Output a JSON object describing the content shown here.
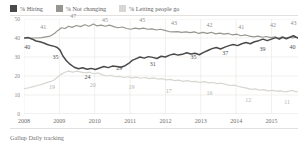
{
  "legend": {
    "items": [
      {
        "label": "% Hiring",
        "color": "#4a4a4c",
        "name": "legend-hiring"
      },
      {
        "label": "% Not changing",
        "color": "#97958f",
        "name": "legend-not-changing"
      },
      {
        "label": "% Letting people go",
        "color": "#d8d6d2",
        "name": "legend-letting-people-go"
      }
    ]
  },
  "footer": {
    "source": "Gallup Daily tracking"
  },
  "chart_data": {
    "type": "line",
    "title": "",
    "subtitle": "",
    "xlabel": "",
    "ylabel": "",
    "ylim": [
      0,
      50
    ],
    "yticks": [
      0,
      10,
      20,
      30,
      40,
      50
    ],
    "xticks": [
      "2008",
      "2009",
      "2010",
      "2011",
      "2012",
      "2013",
      "2014",
      "2015"
    ],
    "xlim": [
      2008,
      2015.75
    ],
    "grid": true,
    "legend_position": "top-left",
    "series": [
      {
        "name": "% Hiring",
        "color": "#4a4a4c",
        "labels": [
          {
            "x": 2008.15,
            "y": 40,
            "text": "40"
          },
          {
            "x": 2008.95,
            "y": 35,
            "text": "35"
          },
          {
            "x": 2009.85,
            "y": 24,
            "text": "24"
          },
          {
            "x": 2010.75,
            "y": 29,
            "text": "29"
          },
          {
            "x": 2011.7,
            "y": 31,
            "text": "31"
          },
          {
            "x": 2012.85,
            "y": 35,
            "text": "35"
          },
          {
            "x": 2013.75,
            "y": 37,
            "text": "37"
          },
          {
            "x": 2014.8,
            "y": 39,
            "text": "39"
          },
          {
            "x": 2015.65,
            "y": 40,
            "text": "40"
          }
        ],
        "points": [
          {
            "x": 2008.02,
            "y": 40.0
          },
          {
            "x": 2008.12,
            "y": 40.2
          },
          {
            "x": 2008.22,
            "y": 39.5
          },
          {
            "x": 2008.34,
            "y": 38.4
          },
          {
            "x": 2008.45,
            "y": 38.0
          },
          {
            "x": 2008.56,
            "y": 37.4
          },
          {
            "x": 2008.66,
            "y": 36.6
          },
          {
            "x": 2008.76,
            "y": 36.0
          },
          {
            "x": 2008.86,
            "y": 35.6
          },
          {
            "x": 2008.94,
            "y": 35.0
          },
          {
            "x": 2009.02,
            "y": 33.6
          },
          {
            "x": 2009.1,
            "y": 30.5
          },
          {
            "x": 2009.2,
            "y": 28.0
          },
          {
            "x": 2009.3,
            "y": 26.2
          },
          {
            "x": 2009.42,
            "y": 24.6
          },
          {
            "x": 2009.54,
            "y": 23.8
          },
          {
            "x": 2009.66,
            "y": 24.3
          },
          {
            "x": 2009.78,
            "y": 23.6
          },
          {
            "x": 2009.9,
            "y": 24.0
          },
          {
            "x": 2010.02,
            "y": 23.4
          },
          {
            "x": 2010.14,
            "y": 24.2
          },
          {
            "x": 2010.26,
            "y": 25.0
          },
          {
            "x": 2010.38,
            "y": 24.4
          },
          {
            "x": 2010.5,
            "y": 25.2
          },
          {
            "x": 2010.62,
            "y": 25.0
          },
          {
            "x": 2010.74,
            "y": 24.6
          },
          {
            "x": 2010.86,
            "y": 25.4
          },
          {
            "x": 2010.96,
            "y": 26.6
          },
          {
            "x": 2011.06,
            "y": 28.2
          },
          {
            "x": 2011.16,
            "y": 29.0
          },
          {
            "x": 2011.28,
            "y": 30.0
          },
          {
            "x": 2011.4,
            "y": 29.4
          },
          {
            "x": 2011.52,
            "y": 30.2
          },
          {
            "x": 2011.64,
            "y": 29.8
          },
          {
            "x": 2011.76,
            "y": 29.2
          },
          {
            "x": 2011.88,
            "y": 30.4
          },
          {
            "x": 2012.0,
            "y": 30.0
          },
          {
            "x": 2012.12,
            "y": 31.0
          },
          {
            "x": 2012.24,
            "y": 31.6
          },
          {
            "x": 2012.36,
            "y": 31.0
          },
          {
            "x": 2012.48,
            "y": 31.4
          },
          {
            "x": 2012.6,
            "y": 32.2
          },
          {
            "x": 2012.72,
            "y": 31.6
          },
          {
            "x": 2012.84,
            "y": 32.0
          },
          {
            "x": 2012.96,
            "y": 31.2
          },
          {
            "x": 2013.08,
            "y": 32.4
          },
          {
            "x": 2013.2,
            "y": 33.4
          },
          {
            "x": 2013.32,
            "y": 34.4
          },
          {
            "x": 2013.44,
            "y": 35.0
          },
          {
            "x": 2013.56,
            "y": 34.2
          },
          {
            "x": 2013.68,
            "y": 35.2
          },
          {
            "x": 2013.8,
            "y": 36.0
          },
          {
            "x": 2013.92,
            "y": 36.6
          },
          {
            "x": 2014.04,
            "y": 36.0
          },
          {
            "x": 2014.16,
            "y": 37.0
          },
          {
            "x": 2014.28,
            "y": 37.6
          },
          {
            "x": 2014.4,
            "y": 37.0
          },
          {
            "x": 2014.52,
            "y": 38.0
          },
          {
            "x": 2014.64,
            "y": 38.6
          },
          {
            "x": 2014.76,
            "y": 39.4
          },
          {
            "x": 2014.88,
            "y": 38.6
          },
          {
            "x": 2015.0,
            "y": 39.4
          },
          {
            "x": 2015.12,
            "y": 40.2
          },
          {
            "x": 2015.22,
            "y": 39.4
          },
          {
            "x": 2015.32,
            "y": 40.4
          },
          {
            "x": 2015.42,
            "y": 39.6
          },
          {
            "x": 2015.52,
            "y": 40.4
          },
          {
            "x": 2015.62,
            "y": 41.2
          },
          {
            "x": 2015.7,
            "y": 40.4
          },
          {
            "x": 2015.75,
            "y": 40.0
          }
        ]
      },
      {
        "name": "% Not changing",
        "color": "#97958f",
        "labels": [
          {
            "x": 2008.6,
            "y": 41,
            "text": "41"
          },
          {
            "x": 2009.45,
            "y": 47,
            "text": "47"
          },
          {
            "x": 2010.35,
            "y": 45,
            "text": "45"
          },
          {
            "x": 2011.4,
            "y": 45,
            "text": "45"
          },
          {
            "x": 2012.3,
            "y": 43,
            "text": "43"
          },
          {
            "x": 2013.3,
            "y": 42,
            "text": "42"
          },
          {
            "x": 2014.2,
            "y": 41,
            "text": "41"
          },
          {
            "x": 2015.1,
            "y": 42,
            "text": "42"
          },
          {
            "x": 2015.68,
            "y": 43,
            "text": "43"
          }
        ],
        "points": [
          {
            "x": 2008.02,
            "y": 40.0
          },
          {
            "x": 2008.14,
            "y": 40.0
          },
          {
            "x": 2008.26,
            "y": 40.0
          },
          {
            "x": 2008.38,
            "y": 40.0
          },
          {
            "x": 2008.5,
            "y": 40.2
          },
          {
            "x": 2008.62,
            "y": 40.6
          },
          {
            "x": 2008.74,
            "y": 41.0
          },
          {
            "x": 2008.86,
            "y": 42.4
          },
          {
            "x": 2008.96,
            "y": 44.0
          },
          {
            "x": 2009.06,
            "y": 45.4
          },
          {
            "x": 2009.16,
            "y": 45.0
          },
          {
            "x": 2009.26,
            "y": 46.2
          },
          {
            "x": 2009.36,
            "y": 45.6
          },
          {
            "x": 2009.48,
            "y": 46.6
          },
          {
            "x": 2009.6,
            "y": 46.0
          },
          {
            "x": 2009.72,
            "y": 47.0
          },
          {
            "x": 2009.84,
            "y": 46.2
          },
          {
            "x": 2009.96,
            "y": 47.4
          },
          {
            "x": 2010.06,
            "y": 46.4
          },
          {
            "x": 2010.18,
            "y": 46.8
          },
          {
            "x": 2010.3,
            "y": 46.2
          },
          {
            "x": 2010.42,
            "y": 46.8
          },
          {
            "x": 2010.54,
            "y": 46.0
          },
          {
            "x": 2010.66,
            "y": 45.4
          },
          {
            "x": 2010.78,
            "y": 45.8
          },
          {
            "x": 2010.9,
            "y": 45.0
          },
          {
            "x": 2011.02,
            "y": 44.6
          },
          {
            "x": 2011.14,
            "y": 45.2
          },
          {
            "x": 2011.26,
            "y": 44.8
          },
          {
            "x": 2011.38,
            "y": 45.2
          },
          {
            "x": 2011.5,
            "y": 44.6
          },
          {
            "x": 2011.62,
            "y": 44.8
          },
          {
            "x": 2011.74,
            "y": 44.2
          },
          {
            "x": 2011.86,
            "y": 44.6
          },
          {
            "x": 2011.98,
            "y": 44.0
          },
          {
            "x": 2012.1,
            "y": 43.4
          },
          {
            "x": 2012.22,
            "y": 43.2
          },
          {
            "x": 2012.34,
            "y": 43.4
          },
          {
            "x": 2012.46,
            "y": 43.0
          },
          {
            "x": 2012.58,
            "y": 43.2
          },
          {
            "x": 2012.7,
            "y": 42.8
          },
          {
            "x": 2012.82,
            "y": 43.2
          },
          {
            "x": 2012.94,
            "y": 42.4
          },
          {
            "x": 2013.06,
            "y": 43.0
          },
          {
            "x": 2013.18,
            "y": 42.4
          },
          {
            "x": 2013.3,
            "y": 43.0
          },
          {
            "x": 2013.42,
            "y": 42.2
          },
          {
            "x": 2013.54,
            "y": 42.6
          },
          {
            "x": 2013.66,
            "y": 42.0
          },
          {
            "x": 2013.78,
            "y": 42.4
          },
          {
            "x": 2013.9,
            "y": 41.6
          },
          {
            "x": 2014.02,
            "y": 42.0
          },
          {
            "x": 2014.14,
            "y": 41.2
          },
          {
            "x": 2014.26,
            "y": 41.6
          },
          {
            "x": 2014.38,
            "y": 41.0
          },
          {
            "x": 2014.5,
            "y": 40.6
          },
          {
            "x": 2014.62,
            "y": 41.0
          },
          {
            "x": 2014.74,
            "y": 40.4
          },
          {
            "x": 2014.86,
            "y": 40.8
          },
          {
            "x": 2014.98,
            "y": 40.2
          },
          {
            "x": 2015.1,
            "y": 40.6
          },
          {
            "x": 2015.2,
            "y": 40.0
          },
          {
            "x": 2015.3,
            "y": 40.6
          },
          {
            "x": 2015.4,
            "y": 40.0
          },
          {
            "x": 2015.5,
            "y": 40.4
          },
          {
            "x": 2015.6,
            "y": 40.0
          },
          {
            "x": 2015.68,
            "y": 40.4
          },
          {
            "x": 2015.75,
            "y": 40.2
          }
        ]
      },
      {
        "name": "% Letting people go",
        "color": "#d8d6d2",
        "labels": [
          {
            "x": 2008.85,
            "y": 19,
            "text": "19"
          },
          {
            "x": 2010.0,
            "y": 20,
            "text": "20"
          },
          {
            "x": 2011.1,
            "y": 19,
            "text": "19"
          },
          {
            "x": 2012.15,
            "y": 17,
            "text": "17"
          },
          {
            "x": 2013.3,
            "y": 16,
            "text": "16"
          },
          {
            "x": 2014.4,
            "y": 12,
            "text": "12"
          },
          {
            "x": 2015.5,
            "y": 11,
            "text": "11"
          }
        ],
        "points": [
          {
            "x": 2008.02,
            "y": 13.4
          },
          {
            "x": 2008.14,
            "y": 13.8
          },
          {
            "x": 2008.26,
            "y": 14.4
          },
          {
            "x": 2008.38,
            "y": 15.0
          },
          {
            "x": 2008.5,
            "y": 15.6
          },
          {
            "x": 2008.62,
            "y": 16.4
          },
          {
            "x": 2008.74,
            "y": 17.0
          },
          {
            "x": 2008.86,
            "y": 18.0
          },
          {
            "x": 2008.96,
            "y": 19.6
          },
          {
            "x": 2009.06,
            "y": 21.0
          },
          {
            "x": 2009.16,
            "y": 22.0
          },
          {
            "x": 2009.26,
            "y": 22.6
          },
          {
            "x": 2009.38,
            "y": 22.0
          },
          {
            "x": 2009.5,
            "y": 22.6
          },
          {
            "x": 2009.62,
            "y": 22.0
          },
          {
            "x": 2009.74,
            "y": 21.6
          },
          {
            "x": 2009.86,
            "y": 22.0
          },
          {
            "x": 2009.98,
            "y": 21.2
          },
          {
            "x": 2010.1,
            "y": 21.6
          },
          {
            "x": 2010.22,
            "y": 20.6
          },
          {
            "x": 2010.34,
            "y": 20.0
          },
          {
            "x": 2010.46,
            "y": 20.4
          },
          {
            "x": 2010.58,
            "y": 19.6
          },
          {
            "x": 2010.7,
            "y": 19.8
          },
          {
            "x": 2010.82,
            "y": 19.2
          },
          {
            "x": 2010.94,
            "y": 19.6
          },
          {
            "x": 2011.06,
            "y": 19.0
          },
          {
            "x": 2011.18,
            "y": 19.4
          },
          {
            "x": 2011.3,
            "y": 18.8
          },
          {
            "x": 2011.42,
            "y": 19.2
          },
          {
            "x": 2011.54,
            "y": 18.6
          },
          {
            "x": 2011.66,
            "y": 19.0
          },
          {
            "x": 2011.78,
            "y": 18.4
          },
          {
            "x": 2011.9,
            "y": 18.6
          },
          {
            "x": 2012.02,
            "y": 18.0
          },
          {
            "x": 2012.14,
            "y": 18.2
          },
          {
            "x": 2012.26,
            "y": 17.6
          },
          {
            "x": 2012.38,
            "y": 17.8
          },
          {
            "x": 2012.5,
            "y": 17.2
          },
          {
            "x": 2012.62,
            "y": 17.6
          },
          {
            "x": 2012.74,
            "y": 17.0
          },
          {
            "x": 2012.86,
            "y": 17.2
          },
          {
            "x": 2012.98,
            "y": 16.6
          },
          {
            "x": 2013.1,
            "y": 17.0
          },
          {
            "x": 2013.22,
            "y": 16.4
          },
          {
            "x": 2013.34,
            "y": 16.6
          },
          {
            "x": 2013.46,
            "y": 16.0
          },
          {
            "x": 2013.58,
            "y": 16.2
          },
          {
            "x": 2013.7,
            "y": 15.6
          },
          {
            "x": 2013.82,
            "y": 15.0
          },
          {
            "x": 2013.94,
            "y": 15.2
          },
          {
            "x": 2014.06,
            "y": 14.6
          },
          {
            "x": 2014.18,
            "y": 14.0
          },
          {
            "x": 2014.3,
            "y": 13.6
          },
          {
            "x": 2014.42,
            "y": 13.0
          },
          {
            "x": 2014.54,
            "y": 13.2
          },
          {
            "x": 2014.66,
            "y": 12.6
          },
          {
            "x": 2014.78,
            "y": 12.8
          },
          {
            "x": 2014.9,
            "y": 12.2
          },
          {
            "x": 2015.02,
            "y": 12.4
          },
          {
            "x": 2015.14,
            "y": 12.0
          },
          {
            "x": 2015.26,
            "y": 12.2
          },
          {
            "x": 2015.38,
            "y": 11.6
          },
          {
            "x": 2015.5,
            "y": 12.0
          },
          {
            "x": 2015.6,
            "y": 12.4
          },
          {
            "x": 2015.68,
            "y": 11.8
          },
          {
            "x": 2015.75,
            "y": 11.6
          }
        ]
      }
    ]
  }
}
